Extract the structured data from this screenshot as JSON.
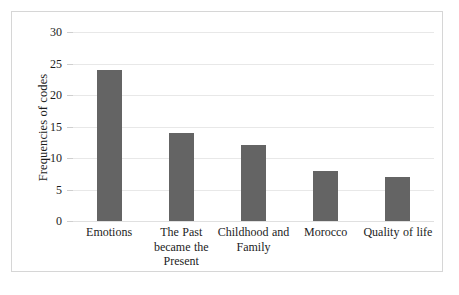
{
  "chart_data": {
    "type": "bar",
    "title": "",
    "xlabel": "",
    "ylabel": "Frequencies of codes",
    "categories": [
      "Emotions",
      "The Past became the Present",
      "Childhood and Family",
      "Morocco",
      "Quality of life"
    ],
    "values": [
      24,
      14,
      12,
      8,
      7
    ],
    "ylim": [
      0,
      30
    ],
    "yticks": [
      0,
      5,
      10,
      15,
      20,
      25,
      30
    ],
    "ytick_labels": [
      "0",
      "5",
      "10",
      "15",
      "20",
      "25",
      "30"
    ],
    "grid": true,
    "legend": false,
    "bar_color": "#646464",
    "gridline_color": "#E8E8E8",
    "frame_color": "#D6D6D6",
    "background_color": "#FFFFFF"
  }
}
